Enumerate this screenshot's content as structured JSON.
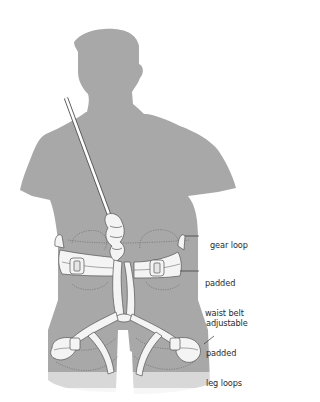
{
  "figure": {
    "colors": {
      "silhouette": "#a8a8a8",
      "background": "#ffffff",
      "harness_fill": "#f4f4f4",
      "outline": "#555555",
      "label_text": "#2a2a2a"
    }
  },
  "labels": [
    {
      "id": "gear-loop",
      "text": "gear loop"
    },
    {
      "id": "padded-waist-belt",
      "line1": "padded",
      "line2": "waist belt"
    },
    {
      "id": "adjustable-padded-leg-loops",
      "line1": "adjustable",
      "line2": "padded",
      "line3": "leg loops"
    }
  ]
}
